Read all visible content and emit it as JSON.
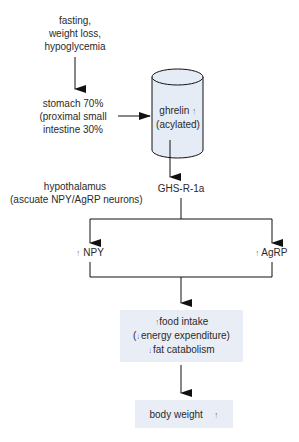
{
  "nodes": {
    "trigger": [
      "fasting,",
      "weight loss,",
      "hypoglycemia"
    ],
    "source": [
      "stomach 70%",
      "(proximal small",
      "intestine 30%"
    ],
    "hormone": {
      "name": "ghrelin",
      "form": "(acylated)",
      "change": "↑"
    },
    "receptor": "GHS-R-1a",
    "location": [
      "hypothalamus",
      "(ascuate NPY/AgRP neurons)"
    ],
    "npy": {
      "label": "NPY",
      "change": "↑"
    },
    "agrp": {
      "label": "AgRP",
      "change": "↑"
    },
    "effects": {
      "food_intake": {
        "change": "↑",
        "label": "food intake"
      },
      "energy": {
        "open": "(",
        "change": "↓",
        "label": "energy expenditure)"
      },
      "fat": {
        "change": "↓",
        "label": "fat catabolism"
      }
    },
    "outcome": {
      "label": "body weight",
      "change": "↑"
    }
  },
  "colors": {
    "cylinder_fill": "#e6ecf5",
    "box_fill": "#e9eef6",
    "stroke": "#1a1a1a"
  }
}
